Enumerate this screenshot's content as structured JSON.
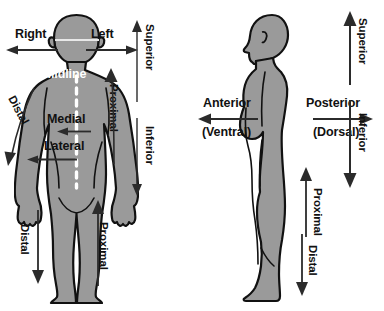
{
  "diagram": {
    "background_color": "#ffffff",
    "body_fill_color": "#9a9a9a",
    "body_outline_color": "#111111",
    "arrow_color": "#2b2b2b",
    "label_color": "#111111",
    "midline_color": "#ffffff"
  },
  "panels": [
    {
      "name": "anterior-view",
      "view": "Anterior (front) view of the human body",
      "labels": {
        "right": "Right",
        "left": "Left",
        "midline": "Midline",
        "medial": "Medial",
        "lateral": "Lateral",
        "superior": "Superior",
        "inferior": "Inferior",
        "arm_proximal": "Proximal",
        "arm_distal": "Distal",
        "leg_proximal": "Proximal",
        "leg_distal": "Distal"
      }
    },
    {
      "name": "lateral-view",
      "view": "Lateral (side) view of the human body",
      "labels": {
        "anterior": "Anterior",
        "ventral": "(Ventral)",
        "posterior": "Posterior",
        "dorsal": "(Dorsal)",
        "superior": "Superior",
        "inferior": "Inferior",
        "leg_proximal": "Proximal",
        "leg_distal": "Distal"
      }
    }
  ],
  "icons": {
    "arrow_left": "arrow-left-icon",
    "arrow_right": "arrow-right-icon",
    "arrow_up": "arrow-up-icon",
    "arrow_down": "arrow-down-icon",
    "midline_dashes": "dashed-midline-icon"
  }
}
